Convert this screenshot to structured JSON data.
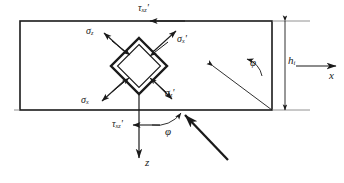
{
  "figure": {
    "background": "#ffffff",
    "line_color": "#1a1a1a",
    "thin_line_color": "#555555",
    "width": 344,
    "height": 183
  },
  "labels": {
    "tau_top": {
      "symbol": "τ",
      "sub": "xz",
      "prime": "'",
      "x": 138,
      "y": 6
    },
    "tau_bottom": {
      "symbol": "τ",
      "sub": "xz",
      "prime": "'",
      "x": 113,
      "y": 122
    },
    "sigma_z_upper_left": {
      "symbol": "σ",
      "sub": "z",
      "prime": "",
      "x": 88,
      "y": 30
    },
    "sigma_x_prime_upper_right": {
      "symbol": "σ",
      "sub": "x",
      "prime": "'",
      "x": 177,
      "y": 38
    },
    "sigma_x_lower_left": {
      "symbol": "σ",
      "sub": "x",
      "prime": "",
      "x": 83,
      "y": 99
    },
    "sigma_z_prime_lower_right": {
      "symbol": "σ",
      "sub": "z",
      "prime": "'",
      "x": 166,
      "y": 92
    },
    "phi_right": {
      "symbol": "φ",
      "sub": "",
      "prime": "",
      "x": 251,
      "y": 62
    },
    "phi_bottom": {
      "symbol": "φ",
      "sub": "",
      "prime": "",
      "x": 166,
      "y": 130
    },
    "h_thickness": {
      "symbol": "h",
      "sub": "i",
      "prime": "",
      "x": 286,
      "y": 58
    },
    "axis_x": {
      "symbol": "x",
      "sub": "",
      "prime": "",
      "x": 329,
      "y": 72
    },
    "axis_z": {
      "symbol": "z",
      "sub": "",
      "prime": "",
      "x": 145,
      "y": 160
    }
  },
  "geometry": {
    "rect": {
      "x": 20,
      "y": 21,
      "width": 252,
      "height": 89
    },
    "element": {
      "cx": 139,
      "cy": 66,
      "half_diagonal": 28,
      "rotation_deg": 45
    },
    "axes_origin": {
      "x": 139,
      "y": 66
    },
    "angle_phi_deg": 45
  },
  "icon_names": {
    "stress_arrow": "stress-arrow-icon",
    "load_arrow": "load-arrow-icon",
    "axis_arrow": "axis-arrow-icon",
    "angle_arc": "angle-arc-icon",
    "dimension_line": "dimension-line-icon"
  }
}
